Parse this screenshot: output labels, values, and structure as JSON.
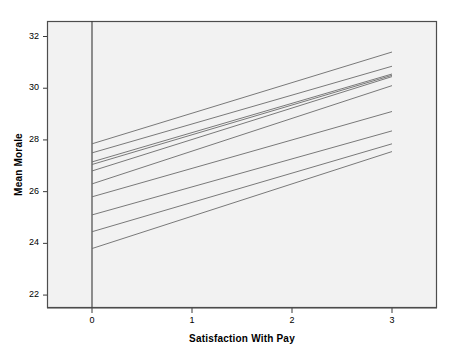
{
  "chart_data": {
    "type": "line",
    "title": "",
    "xlabel": "Satisfaction With Pay",
    "ylabel": "Mean Morale",
    "xlim": [
      -0.45,
      3.45
    ],
    "ylim": [
      21.5,
      32.6
    ],
    "xticks": [
      0,
      1,
      2,
      3
    ],
    "xtick_labels": [
      "0",
      "1",
      "2",
      "3"
    ],
    "yticks": [
      22,
      24,
      26,
      28,
      30,
      32
    ],
    "ytick_labels": [
      "22",
      "24",
      "26",
      "28",
      "30",
      "32"
    ],
    "grid": false,
    "legend": false,
    "legend_position": "none",
    "line_color": "#6b6b6b",
    "plot_background": "#f2f2f2",
    "figure_background": "#ffffff",
    "border_color": "#4d4d4d",
    "x": [
      0,
      3
    ],
    "series": [
      {
        "name": "line-1",
        "values": [
          27.85,
          31.4
        ]
      },
      {
        "name": "line-2",
        "values": [
          27.5,
          30.85
        ]
      },
      {
        "name": "line-3",
        "values": [
          27.15,
          30.55
        ]
      },
      {
        "name": "line-4",
        "values": [
          27.05,
          30.5
        ]
      },
      {
        "name": "line-5",
        "values": [
          26.8,
          30.45
        ]
      },
      {
        "name": "line-6",
        "values": [
          26.3,
          30.1
        ]
      },
      {
        "name": "line-7",
        "values": [
          25.8,
          29.1
        ]
      },
      {
        "name": "line-8",
        "values": [
          25.1,
          28.35
        ]
      },
      {
        "name": "line-9",
        "values": [
          24.45,
          27.85
        ]
      },
      {
        "name": "line-10",
        "values": [
          23.8,
          27.55
        ]
      }
    ]
  },
  "axis": {
    "vertical_reference_x": 0
  }
}
